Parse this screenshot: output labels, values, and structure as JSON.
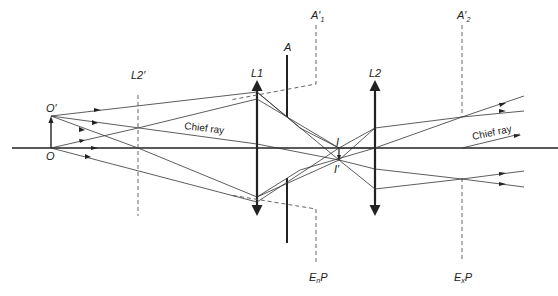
{
  "diagram": {
    "labels": {
      "object": "O",
      "object_tip": "O′",
      "image": "I",
      "image_tip": "I′",
      "lens1": "L1",
      "lens2": "L2",
      "lens2_image": "L2′",
      "aperture": "A",
      "aperture_image1": "A′",
      "aperture_image1_sub": "1",
      "aperture_image2": "A′",
      "aperture_image2_sub": "2",
      "entrance_pupil": "E",
      "entrance_pupil_sub": "n",
      "entrance_pupil_suffix": "P",
      "exit_pupil": "E",
      "exit_pupil_sub": "x",
      "exit_pupil_suffix": "P",
      "chief_ray_left": "Chief ray",
      "chief_ray_right": "Chief ray"
    },
    "colors": {
      "line": "#222222",
      "ray": "#333333",
      "dashed": "#555555",
      "background": "#ffffff"
    }
  }
}
